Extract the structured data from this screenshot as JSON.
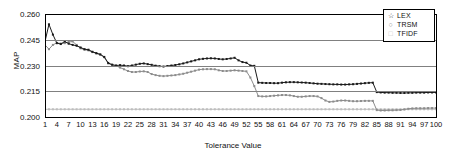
{
  "chart_data": {
    "type": "line",
    "title": "",
    "xlabel": "Tolerance Value",
    "ylabel": "MAP",
    "xlim": [
      1,
      100
    ],
    "ylim": [
      0.2,
      0.26
    ],
    "yticks": [
      "0.260",
      "0.245",
      "0.230",
      "0.215",
      "0.200"
    ],
    "ytick_values": [
      0.26,
      0.245,
      0.23,
      0.215,
      0.2
    ],
    "xticks": [
      1,
      4,
      7,
      10,
      13,
      16,
      19,
      22,
      25,
      28,
      31,
      34,
      37,
      40,
      43,
      46,
      49,
      52,
      55,
      58,
      61,
      64,
      67,
      70,
      73,
      76,
      79,
      82,
      85,
      88,
      91,
      94,
      97,
      100
    ],
    "grid": true,
    "legend_position": "top-right",
    "x": [
      1,
      2,
      3,
      4,
      5,
      6,
      7,
      8,
      9,
      10,
      11,
      12,
      13,
      14,
      15,
      16,
      17,
      18,
      19,
      20,
      21,
      22,
      23,
      24,
      25,
      26,
      27,
      28,
      29,
      30,
      31,
      32,
      33,
      34,
      35,
      36,
      37,
      38,
      39,
      40,
      41,
      42,
      43,
      44,
      45,
      46,
      47,
      48,
      49,
      50,
      51,
      52,
      53,
      54,
      55,
      56,
      57,
      58,
      59,
      60,
      61,
      62,
      63,
      64,
      65,
      66,
      67,
      68,
      69,
      70,
      71,
      72,
      73,
      74,
      75,
      76,
      77,
      78,
      79,
      80,
      81,
      82,
      83,
      84,
      85,
      86,
      87,
      88,
      89,
      90,
      91,
      92,
      93,
      94,
      95,
      96,
      97,
      98,
      99,
      100
    ],
    "series": [
      {
        "name": "LEX",
        "color": "#1a1a1a",
        "marker": "star",
        "marker_glyph": "☆",
        "values": [
          0.244,
          0.254,
          0.248,
          0.243,
          0.2425,
          0.244,
          0.2427,
          0.242,
          0.2415,
          0.2405,
          0.2395,
          0.2392,
          0.238,
          0.2372,
          0.2365,
          0.235,
          0.2315,
          0.2305,
          0.23,
          0.2302,
          0.23,
          0.2296,
          0.23,
          0.2305,
          0.231,
          0.2312,
          0.2308,
          0.2304,
          0.2299,
          0.2296,
          0.2294,
          0.2297,
          0.23,
          0.2303,
          0.2307,
          0.2312,
          0.2318,
          0.2324,
          0.233,
          0.2336,
          0.2339,
          0.2341,
          0.2342,
          0.2341,
          0.2338,
          0.2336,
          0.2338,
          0.2341,
          0.2345,
          0.233,
          0.232,
          0.2316,
          0.23,
          0.2298,
          0.22,
          0.2199,
          0.2198,
          0.2198,
          0.2197,
          0.2197,
          0.22,
          0.2202,
          0.2203,
          0.2203,
          0.2202,
          0.2201,
          0.22,
          0.2198,
          0.2196,
          0.2194,
          0.2193,
          0.2192,
          0.2191,
          0.219,
          0.219,
          0.2189,
          0.2189,
          0.219,
          0.2191,
          0.2193,
          0.2195,
          0.2197,
          0.2199,
          0.22,
          0.2145,
          0.2143,
          0.2142,
          0.2142,
          0.2141,
          0.2141,
          0.214,
          0.214,
          0.2141,
          0.2141,
          0.2142,
          0.2142,
          0.2142,
          0.2143,
          0.2143,
          0.2143
        ]
      },
      {
        "name": "TRSM",
        "color": "#8c8c8c",
        "marker": "circle",
        "marker_glyph": "○",
        "values": [
          0.242,
          0.2395,
          0.242,
          0.2432,
          0.2428,
          0.243,
          0.2437,
          0.244,
          0.242,
          0.24,
          0.2392,
          0.2388,
          0.2378,
          0.237,
          0.2362,
          0.2348,
          0.2312,
          0.2302,
          0.2298,
          0.2288,
          0.2278,
          0.2268,
          0.2262,
          0.2262,
          0.2265,
          0.2266,
          0.2262,
          0.225,
          0.2244,
          0.224,
          0.2238,
          0.224,
          0.2242,
          0.2244,
          0.2248,
          0.2252,
          0.2258,
          0.2264,
          0.227,
          0.2276,
          0.2278,
          0.2279,
          0.2279,
          0.2278,
          0.2272,
          0.2268,
          0.2268,
          0.227,
          0.2272,
          0.227,
          0.2268,
          0.2266,
          0.223,
          0.218,
          0.2122,
          0.212,
          0.212,
          0.2122,
          0.2124,
          0.2126,
          0.2128,
          0.2128,
          0.2126,
          0.2122,
          0.2118,
          0.2118,
          0.212,
          0.2122,
          0.2122,
          0.212,
          0.211,
          0.2096,
          0.2088,
          0.209,
          0.2094,
          0.2096,
          0.2096,
          0.2094,
          0.2092,
          0.2092,
          0.2093,
          0.2094,
          0.2094,
          0.2094,
          0.204,
          0.2038,
          0.2038,
          0.2039,
          0.2039,
          0.204,
          0.2041,
          0.2044,
          0.2048,
          0.205,
          0.2051,
          0.2051,
          0.2051,
          0.2052,
          0.2052,
          0.2052
        ]
      },
      {
        "name": "TFIDF",
        "color": "#bdbdbd",
        "marker": "square",
        "marker_glyph": "□",
        "values": [
          0.2045,
          0.2045,
          0.2045,
          0.2045,
          0.2045,
          0.2045,
          0.2045,
          0.2045,
          0.2045,
          0.2045,
          0.2045,
          0.2045,
          0.2045,
          0.2045,
          0.2045,
          0.2045,
          0.2045,
          0.2045,
          0.2045,
          0.2045,
          0.2045,
          0.2045,
          0.2045,
          0.2045,
          0.2045,
          0.2045,
          0.2045,
          0.2045,
          0.2045,
          0.2045,
          0.2045,
          0.2045,
          0.2045,
          0.2045,
          0.2045,
          0.2045,
          0.2045,
          0.2045,
          0.2045,
          0.2045,
          0.2045,
          0.2045,
          0.2045,
          0.2045,
          0.2045,
          0.2045,
          0.2045,
          0.2045,
          0.2045,
          0.2045,
          0.2045,
          0.2045,
          0.2045,
          0.2045,
          0.2045,
          0.2045,
          0.2045,
          0.2045,
          0.2045,
          0.2045,
          0.2045,
          0.2045,
          0.2045,
          0.2045,
          0.2045,
          0.2045,
          0.2045,
          0.2045,
          0.2045,
          0.2045,
          0.2045,
          0.2045,
          0.2045,
          0.2045,
          0.2045,
          0.2045,
          0.2045,
          0.2045,
          0.2045,
          0.2045,
          0.2045,
          0.2045,
          0.2045,
          0.2045,
          0.2045,
          0.2045,
          0.2045,
          0.2045,
          0.2045,
          0.2045,
          0.2045,
          0.2045,
          0.2045,
          0.2045,
          0.2045,
          0.2045,
          0.2045,
          0.2045,
          0.2045,
          0.2045
        ]
      }
    ]
  },
  "legend": {
    "items": [
      {
        "label": "LEX"
      },
      {
        "label": "TRSM"
      },
      {
        "label": "TFIDF"
      }
    ]
  }
}
